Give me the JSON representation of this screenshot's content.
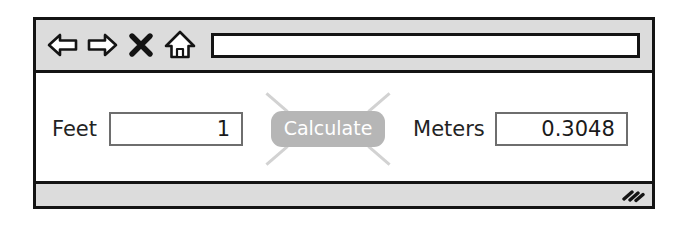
{
  "window": {
    "frame_color": "#141414",
    "chrome_color": "#dcdcdc",
    "content_color": "#ffffff"
  },
  "toolbar": {
    "buttons": [
      {
        "name": "back-icon",
        "label": "Back"
      },
      {
        "name": "forward-icon",
        "label": "Forward"
      },
      {
        "name": "stop-icon",
        "label": "Stop"
      },
      {
        "name": "home-icon",
        "label": "Home"
      }
    ],
    "address_bar": {
      "value": "",
      "placeholder": ""
    }
  },
  "main": {
    "feet": {
      "label": "Feet",
      "value": "1",
      "placeholder": ""
    },
    "calculate": {
      "label": "Calculate",
      "button_color": "#b6b6b6",
      "text_color": "#ffffff",
      "spark_color": "#d2d2d2"
    },
    "meters": {
      "label": "Meters",
      "value": "0.3048",
      "placeholder": ""
    }
  },
  "status_bar": {
    "text": "",
    "resize_grip_icon": "resize-grip-icon"
  }
}
